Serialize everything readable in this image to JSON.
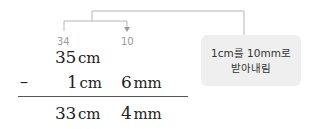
{
  "diagram": {
    "type": "vertical-subtraction-with-borrow",
    "borrow_marks": {
      "tens_changed_to": "34",
      "borrowed_to_mm": "10"
    },
    "rows": [
      {
        "operator": "",
        "cm_value": "35",
        "cm_unit": "cm",
        "mm_value": "",
        "mm_unit": ""
      },
      {
        "operator": "–",
        "cm_value": "1",
        "cm_unit": "cm",
        "mm_value": "6",
        "mm_unit": "mm"
      },
      {
        "operator": "",
        "cm_value": "33",
        "cm_unit": "cm",
        "mm_value": "4",
        "mm_unit": "mm"
      }
    ],
    "annotation": {
      "line1": "1cm를 10mm로",
      "line2": "받아내림"
    },
    "colors": {
      "connector": "#b5b5b5",
      "annotation_bg": "#efefef",
      "borrow_text": "#9a9a9a",
      "main_text": "#222222"
    }
  }
}
